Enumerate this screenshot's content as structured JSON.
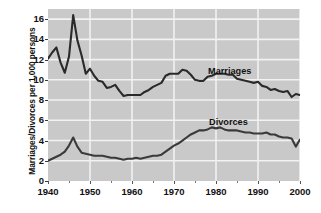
{
  "chart_data": {
    "type": "line",
    "title": "",
    "xlabel": "",
    "ylabel": "Marriages/Divorces per 1,000 persons",
    "xlim": [
      1940,
      2000
    ],
    "ylim": [
      0,
      17
    ],
    "grid": true,
    "legend_position": "inline-annotations",
    "y_ticks": [
      0,
      2,
      4,
      6,
      8,
      10,
      12,
      14,
      16
    ],
    "y_tick_labels": [
      "0",
      "2",
      "4",
      "6",
      "8",
      "10",
      "12",
      "14",
      "16"
    ],
    "x_ticks": [
      1940,
      1950,
      1960,
      1970,
      1980,
      1990,
      2000
    ],
    "x_tick_labels": [
      "1940",
      "1950",
      "1960",
      "1970",
      "1980",
      "1990",
      "2000"
    ],
    "x_minor_ticks": [
      1945,
      1955,
      1965,
      1975,
      1985,
      1995
    ],
    "annotations": [
      {
        "text": "Marriages",
        "x": 1982,
        "y": 11.6
      },
      {
        "text": "Divorces",
        "x": 1982,
        "y": 6.3
      }
    ],
    "x": [
      1940,
      1941,
      1942,
      1943,
      1944,
      1945,
      1946,
      1947,
      1948,
      1949,
      1950,
      1951,
      1952,
      1953,
      1954,
      1955,
      1956,
      1957,
      1958,
      1959,
      1960,
      1961,
      1962,
      1963,
      1964,
      1965,
      1966,
      1967,
      1968,
      1969,
      1970,
      1971,
      1972,
      1973,
      1974,
      1975,
      1976,
      1977,
      1978,
      1979,
      1980,
      1981,
      1982,
      1983,
      1984,
      1985,
      1986,
      1987,
      1988,
      1989,
      1990,
      1991,
      1992,
      1993,
      1994,
      1995,
      1996,
      1997,
      1998,
      1999,
      2000
    ],
    "series": [
      {
        "name": "Marriages",
        "color": "#2a2a2a",
        "values": [
          12.1,
          12.7,
          13.2,
          11.7,
          10.7,
          12.3,
          16.4,
          13.9,
          12.4,
          10.6,
          11.1,
          10.4,
          9.9,
          9.8,
          9.2,
          9.3,
          9.5,
          8.9,
          8.4,
          8.5,
          8.5,
          8.5,
          8.5,
          8.8,
          9.0,
          9.3,
          9.5,
          9.7,
          10.4,
          10.6,
          10.6,
          10.6,
          11.0,
          10.9,
          10.5,
          10.0,
          9.9,
          9.9,
          10.3,
          10.4,
          10.6,
          10.6,
          10.6,
          10.5,
          10.5,
          10.1,
          10.0,
          9.9,
          9.8,
          9.7,
          9.8,
          9.4,
          9.3,
          9.0,
          9.1,
          8.9,
          8.8,
          8.9,
          8.3,
          8.6,
          8.5
        ]
      },
      {
        "name": "Divorces",
        "color": "#3a3a3a",
        "values": [
          2.0,
          2.2,
          2.4,
          2.6,
          2.9,
          3.5,
          4.3,
          3.4,
          2.8,
          2.7,
          2.6,
          2.5,
          2.5,
          2.5,
          2.4,
          2.3,
          2.3,
          2.2,
          2.1,
          2.2,
          2.2,
          2.3,
          2.2,
          2.3,
          2.4,
          2.5,
          2.5,
          2.6,
          2.9,
          3.2,
          3.5,
          3.7,
          4.0,
          4.3,
          4.6,
          4.8,
          5.0,
          5.0,
          5.1,
          5.3,
          5.2,
          5.3,
          5.1,
          5.0,
          5.0,
          5.0,
          4.9,
          4.8,
          4.8,
          4.7,
          4.7,
          4.7,
          4.8,
          4.6,
          4.6,
          4.4,
          4.3,
          4.3,
          4.2,
          3.4,
          4.1
        ]
      }
    ]
  },
  "y_axis": {
    "title": "Marriages/Divorces per 1,000 persons"
  }
}
